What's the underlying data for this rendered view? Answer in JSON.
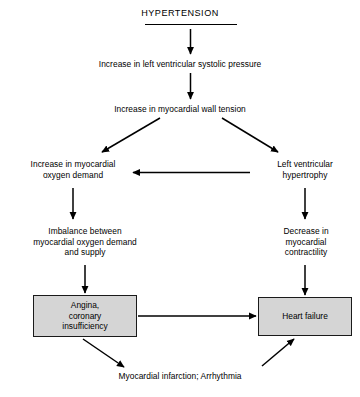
{
  "diagram": {
    "title": "HYPERTENSION",
    "nodes": {
      "systolic_pressure": "Increase in left ventricular systolic pressure",
      "wall_tension": "Increase in myocardial wall tension",
      "oxygen_demand_l1": "Increase in myocardial",
      "oxygen_demand_l2": "oxygen demand",
      "hypertrophy_l1": "Left ventricular",
      "hypertrophy_l2": "hypertrophy",
      "imbalance_l1": "Imbalance between",
      "imbalance_l2": "myocardial oxygen demand",
      "imbalance_l3": "and supply",
      "contractility_l1": "Decrease in",
      "contractility_l2": "myocardial",
      "contractility_l3": "contractility",
      "angina_l1": "Angina,",
      "angina_l2": "coronary",
      "angina_l3": "insufficiency",
      "heart_failure": "Heart failure",
      "outcome": "Myocardial infarction; Arrhythmia"
    },
    "colors": {
      "box_fill": "#d5d5d5",
      "stroke": "#000000",
      "text": "#000000"
    }
  }
}
